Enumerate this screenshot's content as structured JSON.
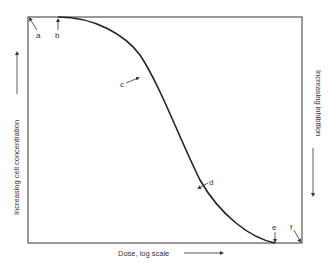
{
  "diagram": {
    "x_axis_label": "Dose, log scale",
    "y_axis_left_label": "Increasing cell concentration",
    "y_axis_right_label": "Increasing inhibition",
    "points": [
      {
        "id": "a",
        "label": "a"
      },
      {
        "id": "b",
        "label": "b"
      },
      {
        "id": "c",
        "label": "c"
      },
      {
        "id": "d",
        "label": "d"
      },
      {
        "id": "e",
        "label": "e"
      },
      {
        "id": "f",
        "label": "f"
      }
    ],
    "colors": {
      "line": "#222222",
      "frame": "#555555",
      "text": "#333333"
    }
  }
}
